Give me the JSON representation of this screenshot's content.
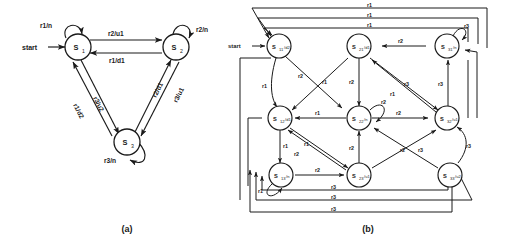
{
  "figure": {
    "panels": [
      {
        "id": "a",
        "caption": "(a)",
        "start_label": "start",
        "states": [
          {
            "id": "s1",
            "name": "S",
            "sub": "1",
            "output": ""
          },
          {
            "id": "s2",
            "name": "S",
            "sub": "2",
            "output": ""
          },
          {
            "id": "s3",
            "name": "S",
            "sub": "3",
            "output": ""
          }
        ],
        "transitions": [
          {
            "from": "s1",
            "to": "s1",
            "label": "r1/n"
          },
          {
            "from": "s2",
            "to": "s2",
            "label": "r2/n"
          },
          {
            "from": "s3",
            "to": "s3",
            "label": "r3/n"
          },
          {
            "from": "s1",
            "to": "s2",
            "label": "r2/u1"
          },
          {
            "from": "s2",
            "to": "s1",
            "label": "r1/d1"
          },
          {
            "from": "s1",
            "to": "s3",
            "label": "r3/u2"
          },
          {
            "from": "s3",
            "to": "s1",
            "label": "r1/d2"
          },
          {
            "from": "s2",
            "to": "s3",
            "label": "r3/u1"
          },
          {
            "from": "s3",
            "to": "s2",
            "label": "r2/d1"
          }
        ]
      },
      {
        "id": "b",
        "caption": "(b)",
        "start_label": "start",
        "states": [
          {
            "id": "s11",
            "name": "S",
            "sub": "11",
            "output": "/d2"
          },
          {
            "id": "s21",
            "name": "S",
            "sub": "21",
            "output": "/d1"
          },
          {
            "id": "s31",
            "name": "S",
            "sub": "31",
            "output": "/n"
          },
          {
            "id": "s12",
            "name": "S",
            "sub": "12",
            "output": "/d1"
          },
          {
            "id": "s22",
            "name": "S",
            "sub": "22",
            "output": "/n"
          },
          {
            "id": "s32",
            "name": "S",
            "sub": "32",
            "output": "/u1"
          },
          {
            "id": "s13",
            "name": "S",
            "sub": "13",
            "output": "/n"
          },
          {
            "id": "s23",
            "name": "S",
            "sub": "23",
            "output": "/u1"
          },
          {
            "id": "s33",
            "name": "S",
            "sub": "33",
            "output": "/u2"
          }
        ],
        "edge_labels": {
          "r1": "r1",
          "r2": "r2",
          "r3": "r3"
        },
        "top_return_labels": [
          "r1",
          "r1",
          "r1"
        ],
        "bottom_return_labels": [
          "r3",
          "r3",
          "r3"
        ]
      }
    ]
  }
}
